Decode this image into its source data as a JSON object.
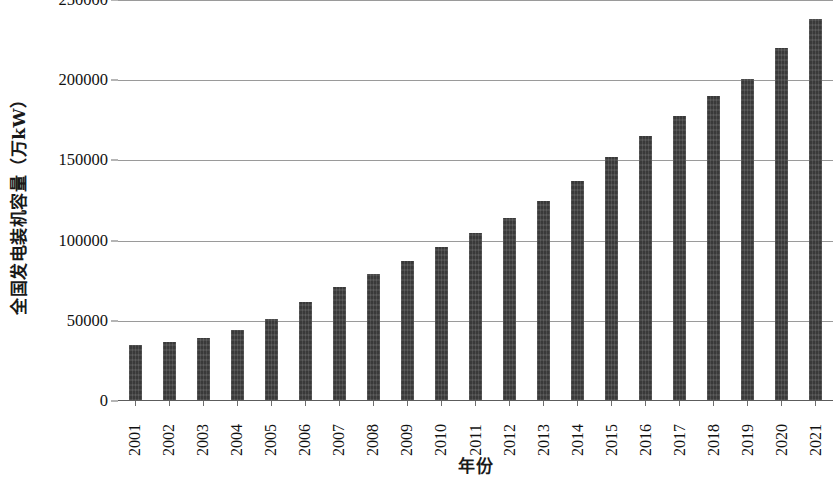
{
  "chart_data": {
    "type": "bar",
    "title": "",
    "xlabel": "年份",
    "ylabel": "全国发电装机容量（万kW）",
    "categories": [
      "2001",
      "2002",
      "2003",
      "2004",
      "2005",
      "2006",
      "2007",
      "2008",
      "2009",
      "2010",
      "2011",
      "2012",
      "2013",
      "2014",
      "2015",
      "2016",
      "2017",
      "2018",
      "2019",
      "2020",
      "2021"
    ],
    "values": [
      35000,
      37000,
      39000,
      44000,
      51000,
      62000,
      71000,
      79000,
      87000,
      96000,
      105000,
      114000,
      125000,
      137000,
      152000,
      165000,
      178000,
      190000,
      201000,
      220000,
      238000
    ],
    "ylim": [
      0,
      250000
    ],
    "yticks": [
      0,
      50000,
      100000,
      150000,
      200000,
      250000
    ],
    "ytick_labels": [
      "0",
      "50000",
      "100000",
      "150000",
      "200000",
      "250000"
    ],
    "grid": true,
    "legend": null,
    "bar_color": "#3d3d3d",
    "gridline_color": "#9a9a9a",
    "axis_color": "#5c5c5c",
    "background_color": "#ffffff"
  }
}
